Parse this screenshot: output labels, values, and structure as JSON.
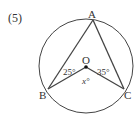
{
  "problem_number": "(5)",
  "points": {
    "A": "A",
    "B": "B",
    "C": "C",
    "O": "O"
  },
  "angles": {
    "OBA": "25°",
    "OCA": "35°",
    "BOC": "x°"
  },
  "colors": {
    "stroke": "#444444",
    "text": "#333333"
  }
}
